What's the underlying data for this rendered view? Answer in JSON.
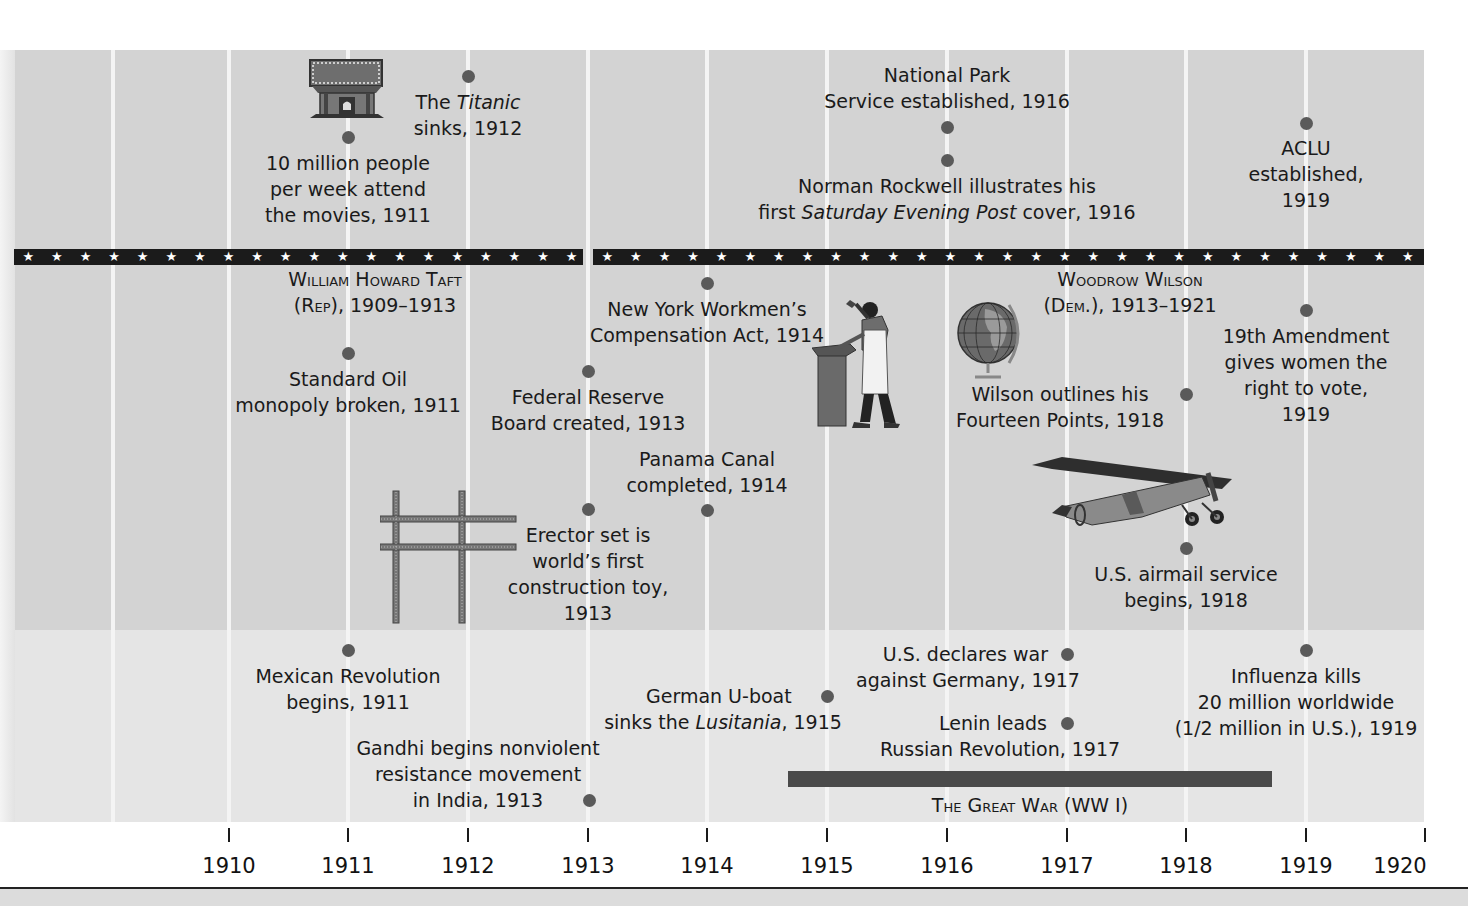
{
  "timeline": {
    "start_year": 1910,
    "end_year": 1920,
    "axis_years": [
      "1910",
      "1911",
      "1912",
      "1913",
      "1914",
      "1915",
      "1916",
      "1917",
      "1918",
      "1919",
      "1920"
    ],
    "colors": {
      "panel_upper": "#d3d3d3",
      "panel_lower": "#e5e5e5",
      "column_lines": "#f4f4f4",
      "star_band": "#1b1b1b",
      "event_dot": "#5a5a5a",
      "war_bar": "#4a4a4a"
    }
  },
  "presidents": [
    {
      "name": "William Howard Taft",
      "party": "Rep",
      "years": "1909–1913"
    },
    {
      "name": "Woodrow Wilson",
      "party": "Dem.",
      "years": "1913–1921"
    }
  ],
  "us_events": {
    "above_band": [
      {
        "id": "movies",
        "lines": [
          "10 million people",
          "per week attend",
          "the movies, 1911"
        ],
        "year": 1911
      },
      {
        "id": "titanic",
        "pre": "The ",
        "italic": "Titanic",
        "line2": "sinks, 1912",
        "year": 1912
      },
      {
        "id": "national-park",
        "lines": [
          "National Park",
          "Service established, 1916"
        ],
        "year": 1916
      },
      {
        "id": "rockwell",
        "line1": "Norman Rockwell illustrates his",
        "pre": "first ",
        "italic": "Saturday Evening Post",
        "post": " cover, 1916",
        "year": 1916
      },
      {
        "id": "aclu",
        "lines": [
          "ACLU",
          "established,",
          "1919"
        ],
        "year": 1919
      }
    ],
    "below_band": [
      {
        "id": "standard-oil",
        "lines": [
          "Standard Oil",
          "monopoly broken, 1911"
        ],
        "year": 1911
      },
      {
        "id": "federal-reserve",
        "lines": [
          "Federal Reserve",
          "Board created, 1913"
        ],
        "year": 1913
      },
      {
        "id": "erector-set",
        "lines": [
          "Erector set is",
          "world’s first",
          "construction toy,",
          "1913"
        ],
        "year": 1913
      },
      {
        "id": "workmens-comp",
        "lines": [
          "New York Workmen’s",
          "Compensation Act, 1914"
        ],
        "year": 1914
      },
      {
        "id": "panama-canal",
        "lines": [
          "Panama Canal",
          "completed, 1914"
        ],
        "year": 1914
      },
      {
        "id": "fourteen-points",
        "lines": [
          "Wilson outlines his",
          "Fourteen Points, 1918"
        ],
        "year": 1918
      },
      {
        "id": "airmail",
        "lines": [
          "U.S. airmail service",
          "begins, 1918"
        ],
        "year": 1918
      },
      {
        "id": "19th-amendment",
        "lines": [
          "19th Amendment",
          "gives women the",
          "right to vote,",
          "1919"
        ],
        "year": 1919
      }
    ]
  },
  "world_events": [
    {
      "id": "mexican-revolution",
      "lines": [
        "Mexican Revolution",
        "begins, 1911"
      ],
      "year": 1911
    },
    {
      "id": "gandhi",
      "lines": [
        "Gandhi begins nonviolent",
        "resistance movement",
        "in India, 1913"
      ],
      "year": 1913
    },
    {
      "id": "lusitania",
      "line1": "German U-boat",
      "pre": "sinks the ",
      "italic": "Lusitania",
      "post": ", 1915",
      "year": 1915
    },
    {
      "id": "us-declares-war",
      "lines": [
        "U.S. declares war",
        "against Germany, 1917"
      ],
      "year": 1917
    },
    {
      "id": "lenin",
      "lines": [
        "Lenin leads",
        "Russian Revolution, 1917"
      ],
      "year": 1917
    },
    {
      "id": "influenza",
      "lines": [
        "Influenza kills",
        "20 million worldwide",
        "(1/2 million in U.S.), 1919"
      ],
      "year": 1919
    }
  ],
  "periods": [
    {
      "id": "great-war",
      "label": "The Great War (WW I)",
      "start": 1914.6,
      "end": 1918.7
    }
  ],
  "illustrations": [
    "movie-theater-icon",
    "erector-set-icon",
    "blacksmith-icon",
    "globe-icon",
    "airplane-icon"
  ]
}
